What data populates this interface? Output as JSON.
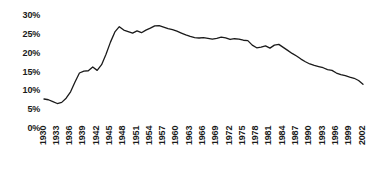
{
  "chart_data": {
    "type": "line",
    "title": "",
    "subtitle": "",
    "xlabel": "",
    "ylabel": "",
    "grid": false,
    "legend": "none",
    "xlim": [
      1930,
      2002
    ],
    "ylim": [
      0,
      30
    ],
    "y_tick_labels": [
      "30%",
      "25%",
      "20%",
      "15%",
      "10%",
      "5%",
      "0%"
    ],
    "y_tick_values": [
      30,
      25,
      20,
      15,
      10,
      5,
      0
    ],
    "x_tick_labels": [
      "1930",
      "1933",
      "1936",
      "1939",
      "1942",
      "1945",
      "1948",
      "1951",
      "1954",
      "1957",
      "1960",
      "1963",
      "1966",
      "1969",
      "1972",
      "1975",
      "1978",
      "1981",
      "1984",
      "1987",
      "1990",
      "1993",
      "1996",
      "1999",
      "2002"
    ],
    "x_tick_values": [
      1930,
      1933,
      1936,
      1939,
      1942,
      1945,
      1948,
      1951,
      1954,
      1957,
      1960,
      1963,
      1966,
      1969,
      1972,
      1975,
      1978,
      1981,
      1984,
      1987,
      1990,
      1993,
      1996,
      1999,
      2002
    ],
    "series": [
      {
        "name": "series-1",
        "color": "#1a1a1a",
        "x": [
          1930,
          1931,
          1932,
          1933,
          1934,
          1935,
          1936,
          1937,
          1938,
          1939,
          1940,
          1941,
          1942,
          1943,
          1944,
          1945,
          1946,
          1947,
          1948,
          1949,
          1950,
          1951,
          1952,
          1953,
          1954,
          1955,
          1956,
          1957,
          1958,
          1959,
          1960,
          1961,
          1962,
          1963,
          1964,
          1965,
          1966,
          1967,
          1968,
          1969,
          1970,
          1971,
          1972,
          1973,
          1974,
          1975,
          1976,
          1977,
          1978,
          1979,
          1980,
          1981,
          1982,
          1983,
          1984,
          1985,
          1986,
          1987,
          1988,
          1989,
          1990,
          1991,
          1992,
          1993,
          1994,
          1995,
          1996,
          1997,
          1998,
          1999,
          2000,
          2001,
          2002
        ],
        "values": [
          7.7,
          7.5,
          7.0,
          6.5,
          6.8,
          7.9,
          9.6,
          12.2,
          14.6,
          15.1,
          15.2,
          16.2,
          15.3,
          16.8,
          19.6,
          22.8,
          25.5,
          26.9,
          26.0,
          25.6,
          25.2,
          25.8,
          25.3,
          26.0,
          26.5,
          27.1,
          27.2,
          26.8,
          26.4,
          26.1,
          25.7,
          25.2,
          24.7,
          24.3,
          24.0,
          23.9,
          24.0,
          23.8,
          23.6,
          23.8,
          24.1,
          23.9,
          23.5,
          23.7,
          23.6,
          23.3,
          23.2,
          22.0,
          21.3,
          21.5,
          21.8,
          21.2,
          22.0,
          22.2,
          21.4,
          20.6,
          19.8,
          19.1,
          18.3,
          17.6,
          17.0,
          16.6,
          16.3,
          16.0,
          15.5,
          15.3,
          14.6,
          14.2,
          13.9,
          13.5,
          13.2,
          12.6,
          11.6
        ]
      }
    ]
  },
  "axis": {
    "y_unit": "%",
    "x_unit": "year"
  }
}
